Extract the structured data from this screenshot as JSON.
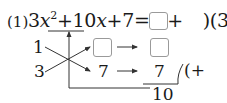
{
  "problem": {
    "number_label": "(1)",
    "equation": {
      "lhs_part1": "3",
      "lhs_var1": "x",
      "lhs_exp": "2",
      "lhs_part2": "+10",
      "lhs_var2": "x",
      "lhs_part3": "+7=(",
      "rhs_var1": "x",
      "rhs_part1": "+",
      "rhs_part2": ")(3",
      "rhs_var2": "x",
      "rhs_part3": "+7)"
    },
    "cross_method": {
      "left_top": "1",
      "left_bottom": "3",
      "mid_bottom": "7",
      "right_bottom": "7",
      "sum_sign": "(+",
      "total": "10"
    },
    "blanks": [
      "equation-blank",
      "cross-product-blank",
      "result-blank"
    ]
  },
  "colors": {
    "text": "#1a1a1a",
    "box_border": "#9a9a9a",
    "line": "#333333"
  }
}
